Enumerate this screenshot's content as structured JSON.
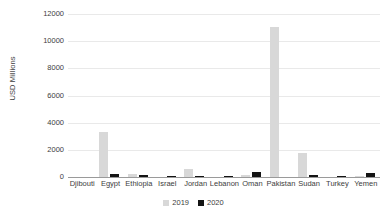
{
  "chart_data": {
    "type": "bar",
    "title": "",
    "subtitle": "",
    "xlabel": "",
    "ylabel": "USD Millions",
    "ylim": [
      0,
      12000
    ],
    "ytick_labels": [
      "12000",
      "10000",
      "8000",
      "6000",
      "4000",
      "2000",
      "0"
    ],
    "ytick_values": [
      12000,
      10000,
      8000,
      6000,
      4000,
      2000,
      0
    ],
    "grid": true,
    "grid_axis": "y",
    "legend_position": "bottom",
    "categories": [
      "Djibouti",
      "Egypt",
      "Ethiopia",
      "Israel",
      "Jordan",
      "Lebanon",
      "Oman",
      "Pakistan",
      "Sudan",
      "Turkey",
      "Yemen"
    ],
    "series": [
      {
        "name": "2019",
        "color": "#d8d8d8",
        "values": [
          0,
          3300,
          250,
          0,
          600,
          0,
          150,
          11050,
          1750,
          0,
          50
        ]
      },
      {
        "name": "2020",
        "color": "#141414",
        "values": [
          0,
          250,
          120,
          60,
          100,
          80,
          380,
          0,
          150,
          100,
          320
        ]
      }
    ]
  },
  "legend": {
    "entries": [
      {
        "label": "2019",
        "color": "#d8d8d8"
      },
      {
        "label": "2020",
        "color": "#141414"
      }
    ]
  }
}
